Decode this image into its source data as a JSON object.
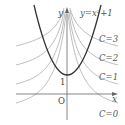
{
  "figure": {
    "axes": {
      "x_label": "x",
      "y_label": "y",
      "origin_label": "O",
      "y_intercept_label": "1"
    },
    "parabola": {
      "equation_label": "y=x²+1",
      "color": "#333333"
    },
    "curve_family": {
      "color": "#b5b5b5",
      "labels": [
        "C=3",
        "C=2",
        "C=1",
        "C=0"
      ]
    }
  }
}
